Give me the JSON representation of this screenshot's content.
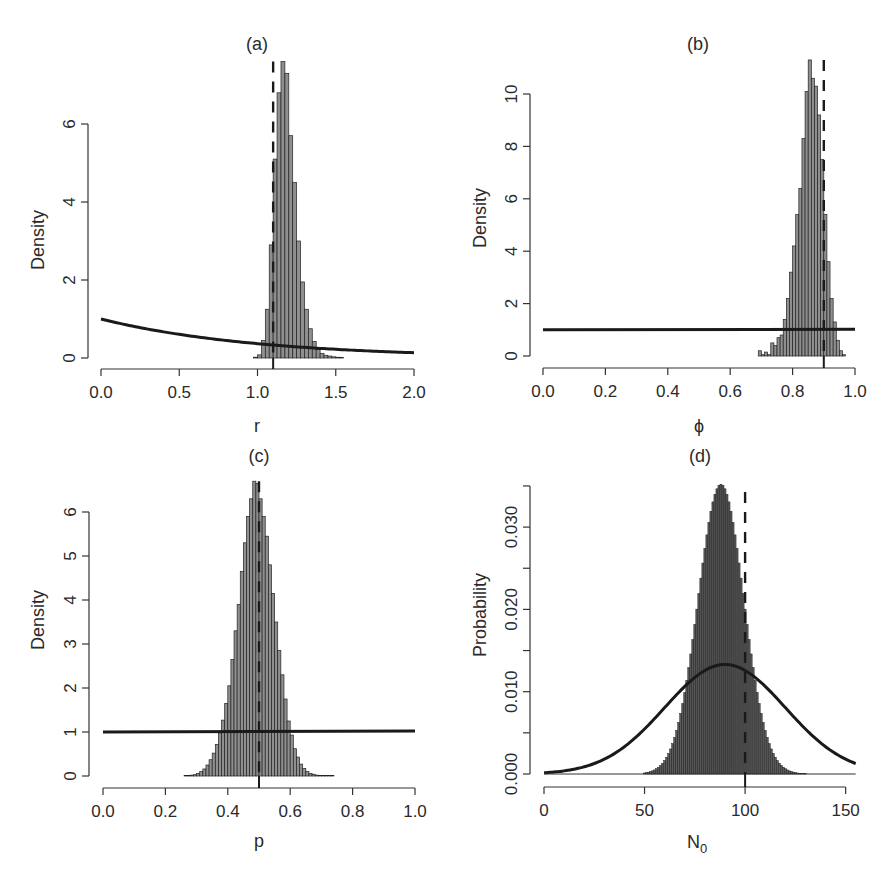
{
  "figure": {
    "panels": [
      {
        "id": "a",
        "title": "(a)",
        "xlabel": "r",
        "ylabel": "Density"
      },
      {
        "id": "b",
        "title": "(b)",
        "xlabel": "ϕ",
        "ylabel": "Density"
      },
      {
        "id": "c",
        "title": "(c)",
        "xlabel": "p",
        "ylabel": "Density"
      },
      {
        "id": "d",
        "title": "(d)",
        "xlabel": "N",
        "xlabel_sub": "0",
        "ylabel": "Probability"
      }
    ]
  },
  "chart_data": [
    {
      "panel": "(a)",
      "type": "bar",
      "title": "(a)",
      "xlabel": "r",
      "ylabel": "Density",
      "xlim": [
        0,
        2
      ],
      "ylim": [
        0,
        7.6
      ],
      "xticks": [
        0.0,
        0.5,
        1.0,
        1.5,
        2.0
      ],
      "xtick_labels": [
        "0.0",
        "0.5",
        "1.0",
        "1.5",
        "2.0"
      ],
      "yticks": [
        0,
        2,
        4,
        6
      ],
      "ytick_labels": [
        "0",
        "2",
        "4",
        "6"
      ],
      "grid": false,
      "histogram": {
        "bin_start": 0.975,
        "bin_width": 0.025,
        "density": [
          0.02,
          0.08,
          0.45,
          1.25,
          2.9,
          5.1,
          6.8,
          7.6,
          7.3,
          5.7,
          4.5,
          3.0,
          1.95,
          1.25,
          0.75,
          0.42,
          0.22,
          0.12,
          0.07,
          0.05,
          0.03,
          0.02,
          0.01
        ]
      },
      "prior": {
        "type": "exponential",
        "rate": 1,
        "label": "prior density"
      },
      "true_value": 1.1
    },
    {
      "panel": "(b)",
      "type": "bar",
      "title": "(b)",
      "xlabel": "ϕ",
      "ylabel": "Density",
      "xlim": [
        0,
        1
      ],
      "ylim": [
        0,
        11.3
      ],
      "xticks": [
        0.0,
        0.2,
        0.4,
        0.6,
        0.8,
        1.0
      ],
      "xtick_labels": [
        "0.0",
        "0.2",
        "0.4",
        "0.6",
        "0.8",
        "1.0"
      ],
      "yticks": [
        0,
        2,
        4,
        6,
        8,
        10
      ],
      "ytick_labels": [
        "0",
        "2",
        "4",
        "6",
        "8",
        "10"
      ],
      "grid": false,
      "histogram": {
        "bin_start": 0.69,
        "bin_width": 0.01,
        "density": [
          0.2,
          0.05,
          0.15,
          0.05,
          0.5,
          0.4,
          0.7,
          0.8,
          1.4,
          2.2,
          3.2,
          4.2,
          5.4,
          6.4,
          8.3,
          10.1,
          11.3,
          10.6,
          10.3,
          9.2,
          7.5,
          5.4,
          3.6,
          2.2,
          1.3,
          0.6,
          0.2,
          0.05
        ]
      },
      "prior": {
        "type": "uniform",
        "min": 0,
        "max": 1,
        "density": 1
      },
      "true_value": 0.9
    },
    {
      "panel": "(c)",
      "type": "bar",
      "title": "(c)",
      "xlabel": "p",
      "ylabel": "Density",
      "xlim": [
        0,
        1
      ],
      "ylim": [
        0,
        6.7
      ],
      "xticks": [
        0.0,
        0.2,
        0.4,
        0.6,
        0.8,
        1.0
      ],
      "xtick_labels": [
        "0.0",
        "0.2",
        "0.4",
        "0.6",
        "0.8",
        "1.0"
      ],
      "yticks": [
        0,
        1,
        2,
        3,
        4,
        5,
        6
      ],
      "ytick_labels": [
        "0",
        "1",
        "2",
        "3",
        "4",
        "5",
        "6"
      ],
      "grid": false,
      "histogram": {
        "bin_start": 0.26,
        "bin_width": 0.01,
        "density": [
          0.01,
          0.01,
          0.02,
          0.03,
          0.06,
          0.1,
          0.16,
          0.25,
          0.37,
          0.52,
          0.72,
          0.98,
          1.27,
          1.65,
          2.05,
          2.65,
          3.3,
          3.9,
          4.65,
          5.3,
          5.9,
          6.3,
          6.7,
          6.65,
          6.3,
          5.9,
          5.45,
          4.8,
          4.15,
          3.5,
          2.85,
          2.3,
          1.75,
          1.25,
          0.93,
          0.62,
          0.43,
          0.27,
          0.17,
          0.1,
          0.06,
          0.04,
          0.02,
          0.01,
          0.01,
          0.01,
          0.01,
          0.01
        ]
      },
      "prior": {
        "type": "uniform",
        "min": 0,
        "max": 1,
        "density": 1
      },
      "true_value": 0.5
    },
    {
      "panel": "(d)",
      "type": "bar",
      "title": "(d)",
      "xlabel": "N0",
      "ylabel": "Probability",
      "xlim": [
        0,
        155
      ],
      "ylim": [
        0,
        0.035
      ],
      "xticks": [
        0,
        50,
        100,
        150
      ],
      "xtick_labels": [
        "0",
        "50",
        "100",
        "150"
      ],
      "yticks": [
        0.0,
        0.005,
        0.01,
        0.015,
        0.02,
        0.025,
        0.03,
        0.035
      ],
      "ytick_labels": [
        "0.000",
        "",
        "0.010",
        "",
        "0.020",
        "",
        "0.030",
        ""
      ],
      "grid": false,
      "histogram": {
        "type": "pmf",
        "center": 88,
        "sd": 11.3,
        "peak": 0.0352,
        "range": [
          50,
          155
        ]
      },
      "prior": {
        "type": "normal",
        "mean": 90,
        "sd": 30,
        "peak": 0.0133
      },
      "true_value": 100
    }
  ]
}
